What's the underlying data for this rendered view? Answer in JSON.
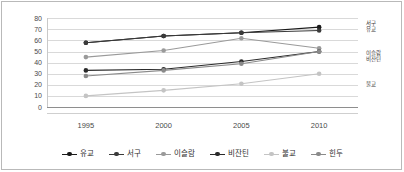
{
  "chart_data": {
    "type": "line",
    "title": "",
    "xlabel": "",
    "ylabel": "",
    "x": [
      "1995",
      "2000",
      "2005",
      "2010"
    ],
    "categories": [
      "1995",
      "2000",
      "2005",
      "2010"
    ],
    "ylim": [
      0,
      80
    ],
    "yticks": [
      "0",
      "10",
      "20",
      "30",
      "40",
      "50",
      "60",
      "70",
      "80"
    ],
    "ytick_values": [
      0,
      10,
      20,
      30,
      40,
      50,
      60,
      70,
      80
    ],
    "grid": true,
    "legend_position": "bottom",
    "series": [
      {
        "name": "유교",
        "values": [
          58,
          64,
          67,
          72
        ],
        "color": "#1a1a1a"
      },
      {
        "name": "서구",
        "values": [
          58,
          64,
          67,
          69
        ],
        "color": "#3a3a3a"
      },
      {
        "name": "이슬람",
        "values": [
          45,
          51,
          62,
          53
        ],
        "color": "#9a9a9a"
      },
      {
        "name": "비잔틴",
        "values": [
          33,
          34,
          41,
          50
        ],
        "color": "#2a2a2a"
      },
      {
        "name": "불교",
        "values": [
          10,
          15,
          21,
          30
        ],
        "color": "#c4c4c4"
      },
      {
        "name": "힌두",
        "values": [
          28,
          33,
          39,
          50
        ],
        "color": "#8a8a8a"
      }
    ],
    "end_labels": [
      {
        "lines": [
          "서구",
          "유교"
        ],
        "x": 366,
        "y": 20
      },
      {
        "lines": [
          "이슬람",
          "비잔틴"
        ],
        "x": 366,
        "y": 50
      },
      {
        "lines": [
          "불교"
        ],
        "x": 366,
        "y": 81
      }
    ]
  },
  "legend": {
    "items": [
      {
        "label": "유교",
        "color": "#1a1a1a"
      },
      {
        "label": "서구",
        "color": "#3a3a3a"
      },
      {
        "label": "이슬람",
        "color": "#9a9a9a"
      },
      {
        "label": "비잔틴",
        "color": "#2a2a2a"
      },
      {
        "label": "불교",
        "color": "#c4c4c4"
      },
      {
        "label": "힌두",
        "color": "#8a8a8a"
      }
    ]
  },
  "colors": {
    "frame": "#b9b9b9",
    "grid": "#d9d9d9",
    "axis": "#8e8e8e",
    "text": "#3d3d3d",
    "background": "#ffffff"
  }
}
